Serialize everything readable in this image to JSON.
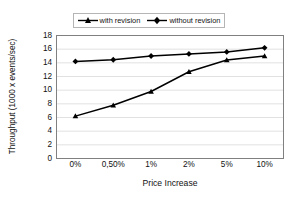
{
  "chart_data": {
    "type": "line",
    "title": "",
    "xlabel": "Price Increase",
    "ylabel": "Throughput (1000 x events/sec)",
    "categories": [
      "0%",
      "0,50%",
      "1%",
      "2%",
      "5%",
      "10%"
    ],
    "series": [
      {
        "name": "with revision",
        "marker": "triangle",
        "color": "#000000",
        "values": [
          6.2,
          7.8,
          9.8,
          12.7,
          14.4,
          15.0
        ]
      },
      {
        "name": "without revision",
        "marker": "diamond",
        "color": "#000000",
        "values": [
          14.2,
          14.45,
          15.0,
          15.3,
          15.6,
          16.2
        ]
      }
    ],
    "ylim": [
      0,
      18
    ],
    "y_ticks": [
      0,
      2,
      4,
      6,
      8,
      10,
      12,
      14,
      16,
      18
    ],
    "y_tick_labels": [
      "0",
      "2",
      "4",
      "6",
      "8",
      "10",
      "12",
      "14",
      "16",
      "18"
    ],
    "grid": "horizontal",
    "legend_position": "top",
    "plot_background": "#ffffff",
    "grid_color": "#d9d9d9",
    "frame_color": "#808080"
  },
  "legend": {
    "entries": [
      {
        "label": "with revision"
      },
      {
        "label": "without revision"
      }
    ]
  }
}
